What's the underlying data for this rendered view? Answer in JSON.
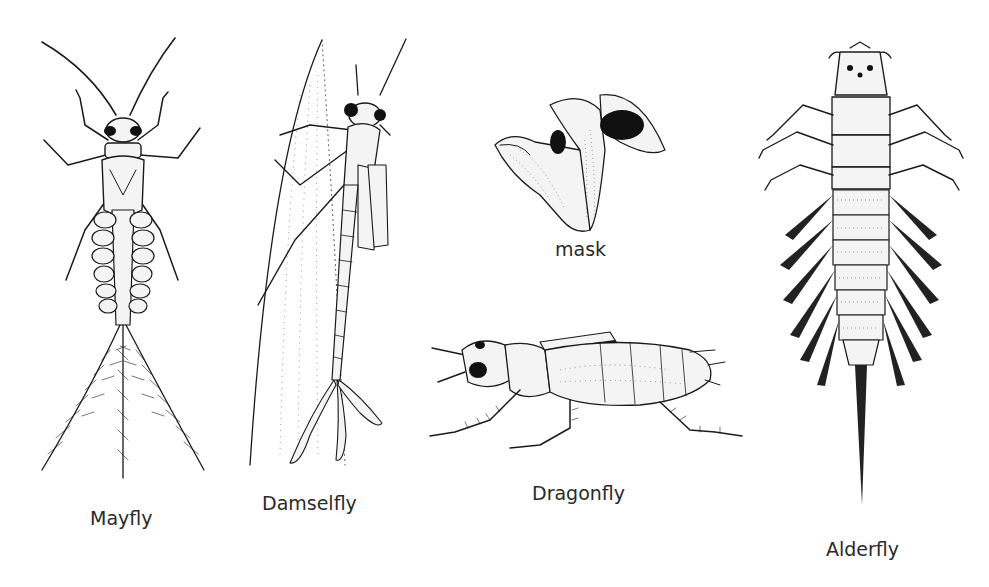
{
  "plate": {
    "description": "Line drawings of aquatic insect nymphs and larvae",
    "background": "#ffffff",
    "ink_color": "#1a1a1a",
    "label_color": "#2a2a2a"
  },
  "specimens": [
    {
      "id": "mayfly",
      "label": "Mayfly",
      "view": "dorsal",
      "features": [
        "long antennae",
        "six legs",
        "paired abdominal gills",
        "three feathered tail filaments"
      ]
    },
    {
      "id": "damselfly",
      "label": "Damselfly",
      "view": "dorsal-oblique on plant stem",
      "features": [
        "large eyes",
        "wing pads",
        "slender abdomen",
        "three leaf-like caudal gills"
      ]
    },
    {
      "id": "mask",
      "label": "mask",
      "view": "detail of extended labial mask"
    },
    {
      "id": "dragonfly",
      "label": "Dragonfly",
      "view": "lateral",
      "features": [
        "large eyes",
        "stout hairy body",
        "wing pads",
        "spiny legs"
      ]
    },
    {
      "id": "alderfly",
      "label": "Alderfly",
      "view": "dorsal",
      "features": [
        "mandibles",
        "six legs",
        "feathery lateral abdominal gills",
        "single long tail filament"
      ]
    }
  ]
}
